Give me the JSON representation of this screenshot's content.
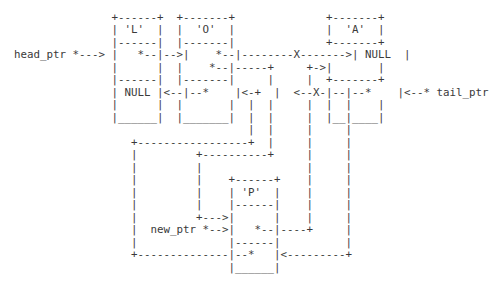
{
  "diagram": {
    "nodes": [
      {
        "id": "L",
        "label": "'L'",
        "next": "*",
        "prev": "NULL"
      },
      {
        "id": "O",
        "label": "'O'",
        "next": "*",
        "prev": "*"
      },
      {
        "id": "A",
        "label": "'A'",
        "next": "NULL",
        "prev": "*"
      },
      {
        "id": "P",
        "label": "'P'",
        "next": "*",
        "prev": "*"
      }
    ],
    "pointers": [
      {
        "name": "head_ptr",
        "target": "L"
      },
      {
        "name": "tail_ptr",
        "target": "A"
      },
      {
        "name": "new_ptr",
        "target": "P"
      }
    ],
    "broken_link_marker": "X",
    "lines": [
      "",
      "                 +------+  +-------+              +-------+",
      "                 | 'L'  |  |  'O'  |              |  'A'  |",
      "                 |------|  |-------|              +-------+",
      "  head_ptr *---> |   *--|-->|    *--|--------X------->| NULL  |",
      "                 |      |  |    *--|-----+     +->|       |",
      "                 |------|  |-------|     |     |  +-------+",
      "                 | NULL |<--|--*    |<-+  |  <--X-|--|--*    |<--* tail_ptr",
      "                 |      |  |       |  |  |     |  |  |    |",
      "                 |______|  |_______|  |  |     |  |__|____|",
      "                                      |  |     |     |",
      "                    +-----------------+  |     |     |",
      "                    |         +----------+     |     |",
      "                    |         |                |     |",
      "                    |         |    +------+    |     |",
      "                    |         |    | 'P'  |    |     |",
      "                    |         |    |------|    |     |",
      "                    |         +--->|      |    |     |",
      "                    |  new_ptr *-->|   *--|----+     |",
      "                    |              |------|          |",
      "                    +--------------|--*   |<---------+",
      "                                   |______|"
    ]
  }
}
